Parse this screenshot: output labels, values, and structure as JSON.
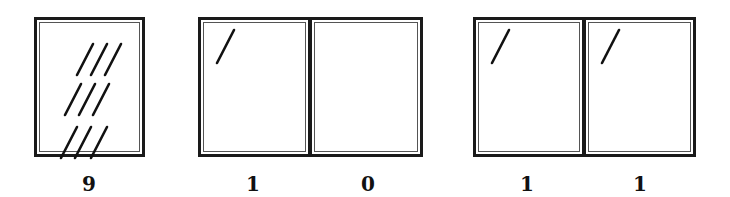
{
  "groups": [
    {
      "frames": [
        {
          "count_label": "9",
          "tally_marks": 9
        }
      ]
    },
    {
      "frames": [
        {
          "count_label": "1",
          "tally_marks": 1
        },
        {
          "count_label": "0",
          "tally_marks": 0
        }
      ]
    },
    {
      "frames": [
        {
          "count_label": "1",
          "tally_marks": 1
        },
        {
          "count_label": "1",
          "tally_marks": 1
        }
      ]
    }
  ],
  "colors": {
    "frame": "#1a1a1a",
    "mark": "#111111"
  }
}
